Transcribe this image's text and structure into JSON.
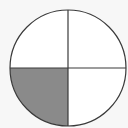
{
  "diagram": {
    "type": "fraction-circle",
    "parts_total": 4,
    "parts_shaded": 1,
    "shaded_quadrant": "bottom-left",
    "fraction": "1/4",
    "colors": {
      "background": "#f7f7f7",
      "fill_unshaded": "#ffffff",
      "fill_shaded": "#8a8a8a",
      "stroke": "#3a3a3a"
    },
    "geometry": {
      "cx": 68,
      "cy": 68,
      "r": 58
    }
  }
}
